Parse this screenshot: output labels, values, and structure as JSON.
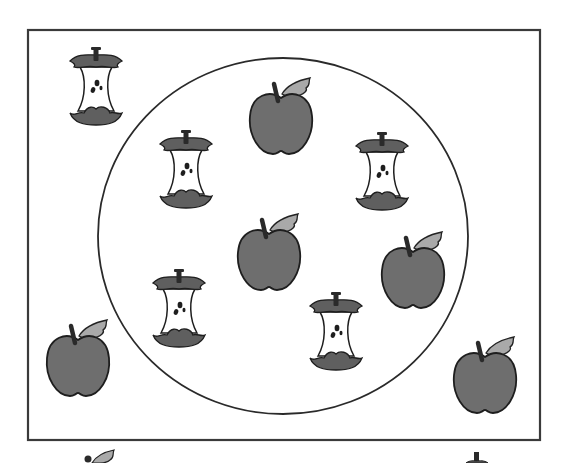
{
  "diagram": {
    "type": "venn-sorting-set",
    "colors": {
      "background": "#ffffff",
      "outline": "#222222",
      "apple_body": "#6e6e6e",
      "leaf": "#a9a9a9",
      "core_flesh": "#ffffff",
      "core_skin": "#5f5f5f",
      "stem": "#2a2a2a"
    },
    "universe_rect": {
      "x": 28,
      "y": 30,
      "width": 512,
      "height": 410
    },
    "subset_circle": {
      "cx": 283,
      "cy": 236,
      "rx": 185,
      "ry": 178
    },
    "apples": [
      {
        "id": "apple-top-center",
        "x": 248,
        "y": 76,
        "inside_circle": true
      },
      {
        "id": "apple-center",
        "x": 236,
        "y": 212,
        "inside_circle": true
      },
      {
        "id": "apple-right",
        "x": 380,
        "y": 230,
        "inside_circle": true
      },
      {
        "id": "apple-bottom-left",
        "x": 46,
        "y": 318,
        "inside_circle": false
      },
      {
        "id": "apple-bottom-right",
        "x": 452,
        "y": 335,
        "inside_circle": false
      }
    ],
    "cores": [
      {
        "id": "core-top-left",
        "x": 69,
        "y": 47,
        "inside_circle": false
      },
      {
        "id": "core-upper-left",
        "x": 159,
        "y": 130,
        "inside_circle": true
      },
      {
        "id": "core-upper-right",
        "x": 355,
        "y": 132,
        "inside_circle": true
      },
      {
        "id": "core-lower-left",
        "x": 152,
        "y": 269,
        "inside_circle": true
      },
      {
        "id": "core-lower-right",
        "x": 309,
        "y": 292,
        "inside_circle": true
      }
    ],
    "partial_items": [
      {
        "id": "partial-apple-leaf-bottom",
        "kind": "apple",
        "x": 84,
        "y": 447
      },
      {
        "id": "partial-core-stem-bottom",
        "kind": "core",
        "x": 462,
        "y": 451
      }
    ],
    "counts": {
      "apples_inside_circle": 3,
      "apples_outside_circle": 2,
      "cores_inside_circle": 4,
      "cores_outside_circle": 1
    }
  }
}
